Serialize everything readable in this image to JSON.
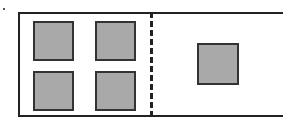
{
  "diagram": {
    "left_region": {
      "squares": [
        {
          "x": 33,
          "y": 21,
          "w": 41,
          "h": 40
        },
        {
          "x": 95,
          "y": 21,
          "w": 41,
          "h": 40
        },
        {
          "x": 33,
          "y": 71,
          "w": 41,
          "h": 40
        },
        {
          "x": 95,
          "y": 71,
          "w": 41,
          "h": 40
        }
      ],
      "count": 4
    },
    "right_region": {
      "squares": [
        {
          "x": 197,
          "y": 43,
          "w": 42,
          "h": 42
        }
      ],
      "count": 1
    },
    "colors": {
      "fill": "#a9a9a9",
      "stroke": "#222222"
    }
  }
}
